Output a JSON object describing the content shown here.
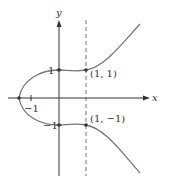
{
  "figure": {
    "axes": {
      "x_label": "x",
      "y_label": "y",
      "x_ticks": [
        {
          "value": -1,
          "label": "−1"
        }
      ],
      "y_ticks": [
        {
          "value": 1,
          "label": "1"
        },
        {
          "value": -1,
          "label": "−1"
        }
      ]
    },
    "points": [
      {
        "x": 1,
        "y": 1,
        "label": "(1, 1)"
      },
      {
        "x": 1,
        "y": -1,
        "label": "(1, −1)"
      }
    ],
    "asymptote_or_guide": {
      "type": "dashed-vertical",
      "x": 1
    },
    "curve": {
      "description": "Symmetric curve about the x-axis passing through (0, ±1) and (1, ±1), crossing the x-axis at about x = −1.5"
    },
    "colors": {
      "axes": "#333333",
      "curve": "#777777",
      "dashed": "#555555",
      "text": "#333333"
    }
  }
}
